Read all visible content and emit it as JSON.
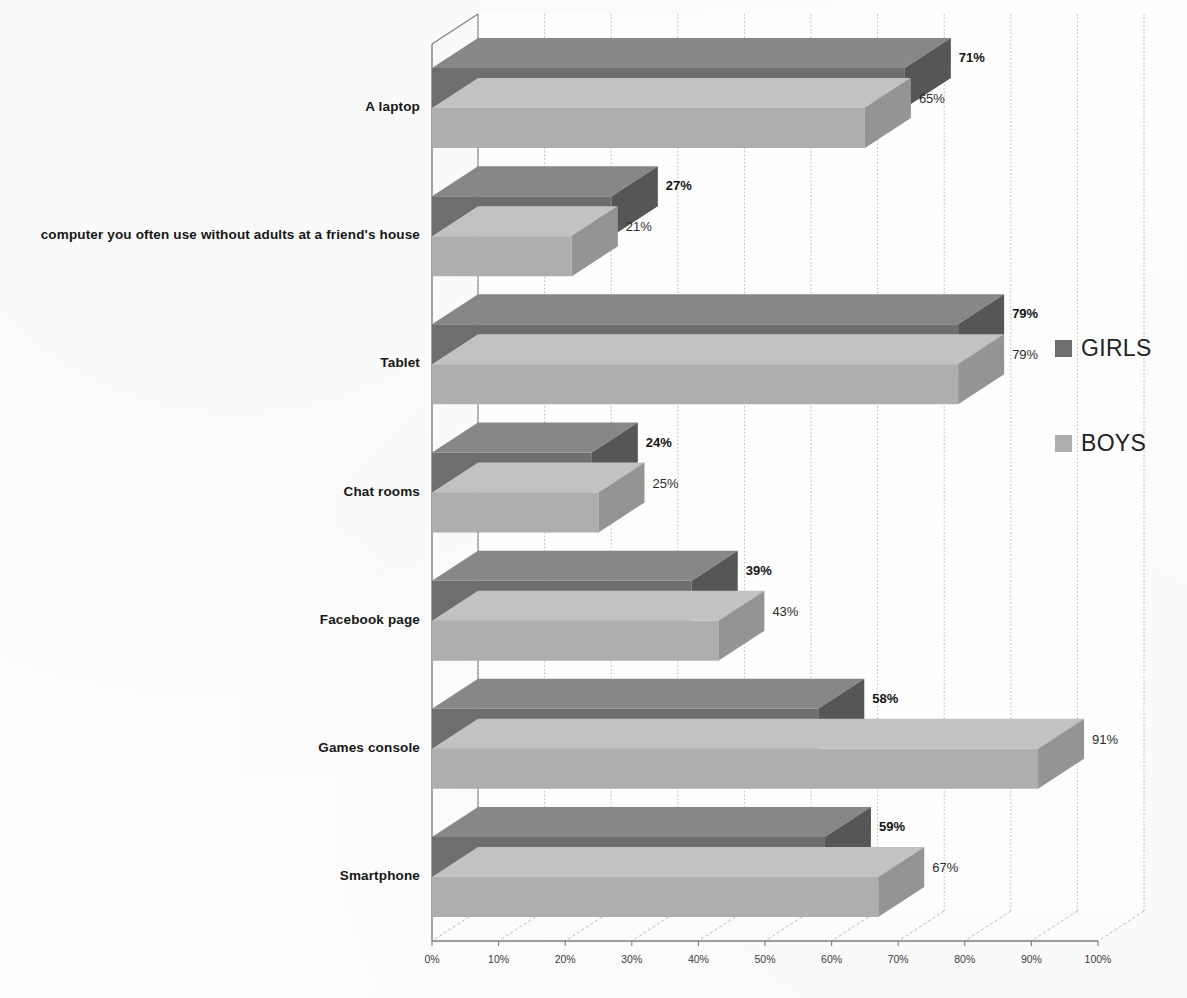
{
  "chart_data": {
    "type": "bar",
    "orientation": "horizontal",
    "style": "3d-clustered-bar",
    "title": "",
    "subtitle": "",
    "xlabel": "",
    "ylabel": "",
    "xlim": [
      0,
      100
    ],
    "xtick_labels": [
      "0%",
      "10%",
      "20%",
      "30%",
      "40%",
      "50%",
      "60%",
      "70%",
      "80%",
      "90%",
      "100%"
    ],
    "xtick_values": [
      0,
      10,
      20,
      30,
      40,
      50,
      60,
      70,
      80,
      90,
      100
    ],
    "grid": true,
    "grid_axis": "x",
    "legend_position": "right",
    "categories": [
      "A laptop",
      "computer you often use without adults at a friend's house",
      "Tablet",
      "Chat rooms",
      "Facebook page",
      "Games console",
      "Smartphone"
    ],
    "series": [
      {
        "name": "GIRLS",
        "color": "#6e6e6e",
        "values": [
          71,
          27,
          79,
          24,
          39,
          58,
          59
        ],
        "value_labels": [
          "71%",
          "27%",
          "79%",
          "24%",
          "39%",
          "58%",
          "59%"
        ]
      },
      {
        "name": "BOYS",
        "color": "#aeaeae",
        "values": [
          65,
          21,
          79,
          25,
          43,
          91,
          67
        ],
        "value_labels": [
          "65%",
          "21%",
          "79%",
          "25%",
          "43%",
          "91%",
          "67%"
        ]
      }
    ]
  },
  "legend": {
    "entries": [
      {
        "label": "GIRLS",
        "color": "#6e6e6e"
      },
      {
        "label": "BOYS",
        "color": "#aeaeae"
      }
    ]
  },
  "colors": {
    "girls_front": "#6e6e6e",
    "girls_top": "#878787",
    "girls_side": "#565656",
    "boys_front": "#aeaeae",
    "boys_top": "#c2c2c2",
    "boys_side": "#949494",
    "axis": "#7d7d7d",
    "grid": "#b9b9b9",
    "background": "#fdfdfd"
  }
}
